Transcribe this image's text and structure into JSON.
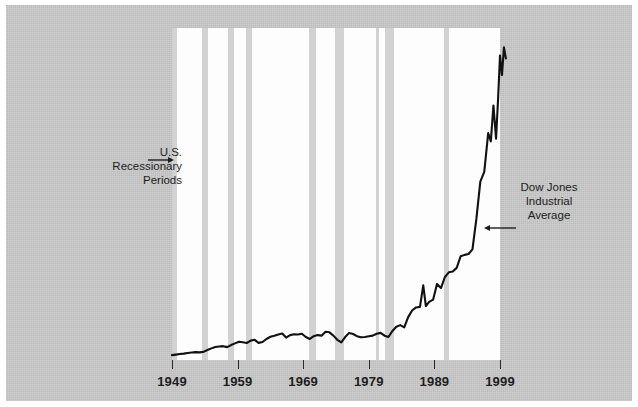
{
  "figure": {
    "background_color": "#c9c9c9",
    "plot_background_color": "#fdfdfd",
    "band_color": "#d2d2d2",
    "line_color": "#111111"
  },
  "annotations": {
    "recession": {
      "line1": "U.S.",
      "line2": "Recessionary",
      "line3": "Periods",
      "arrow": "arrow-right"
    },
    "dow": {
      "line1": "Dow Jones",
      "line2": "Industrial",
      "line3": "Average",
      "arrow": "arrow-left"
    }
  },
  "chart_data": {
    "type": "line",
    "title": "",
    "subtitle": "",
    "xlabel": "",
    "ylabel": "",
    "grid": false,
    "legend_position": "none",
    "xlim": [
      1949,
      1999
    ],
    "ylim": [
      0,
      12000
    ],
    "xticks": [
      1949,
      1959,
      1969,
      1979,
      1989,
      1999
    ],
    "xtick_labels": [
      "1949",
      "1959",
      "1969",
      "1979",
      "1989",
      "1999"
    ],
    "series": [
      {
        "name": "Dow Jones Industrial Average",
        "color": "#111111",
        "x": [
          1949.0,
          1949.6,
          1950.2,
          1950.8,
          1951.4,
          1952.0,
          1952.6,
          1953.2,
          1953.8,
          1954.4,
          1955.0,
          1955.6,
          1956.2,
          1956.8,
          1957.4,
          1958.0,
          1958.6,
          1959.2,
          1959.8,
          1960.4,
          1961.0,
          1961.6,
          1962.2,
          1962.8,
          1963.4,
          1964.0,
          1964.6,
          1965.2,
          1965.8,
          1966.4,
          1967.0,
          1967.6,
          1968.2,
          1968.8,
          1969.4,
          1970.0,
          1970.6,
          1971.2,
          1971.8,
          1972.4,
          1973.0,
          1973.6,
          1974.2,
          1974.8,
          1975.4,
          1976.0,
          1976.6,
          1977.2,
          1977.8,
          1978.4,
          1979.0,
          1979.6,
          1980.2,
          1980.8,
          1981.4,
          1982.0,
          1982.6,
          1983.2,
          1983.8,
          1984.4,
          1985.0,
          1985.6,
          1986.2,
          1986.8,
          1987.3,
          1987.7,
          1988.2,
          1988.8,
          1989.4,
          1990.0,
          1990.6,
          1991.2,
          1991.8,
          1992.4,
          1993.0,
          1993.6,
          1994.2,
          1994.8,
          1995.4,
          1996.0,
          1996.6,
          1997.2,
          1997.6,
          1998.0,
          1998.4,
          1998.7,
          1999.0,
          1999.3,
          1999.6,
          1999.9
        ],
        "y": [
          175,
          195,
          215,
          230,
          255,
          270,
          285,
          275,
          295,
          360,
          420,
          470,
          490,
          500,
          465,
          540,
          600,
          660,
          640,
          615,
          700,
          730,
          620,
          650,
          760,
          840,
          880,
          925,
          960,
          810,
          900,
          930,
          920,
          950,
          830,
          760,
          860,
          900,
          880,
          1020,
          1000,
          880,
          730,
          640,
          830,
          980,
          940,
          860,
          820,
          830,
          860,
          880,
          950,
          980,
          880,
          830,
          1050,
          1200,
          1260,
          1180,
          1550,
          1790,
          1900,
          1920,
          2700,
          1950,
          2100,
          2180,
          2750,
          2600,
          3000,
          3170,
          3200,
          3330,
          3750,
          3800,
          3830,
          4000,
          5100,
          6450,
          6800,
          8200,
          7900,
          9200,
          8000,
          9400,
          11000,
          10300,
          11300,
          10900
        ]
      }
    ],
    "recession_bands": [
      {
        "start": 1948.9,
        "end": 1949.8
      },
      {
        "start": 1953.5,
        "end": 1954.5
      },
      {
        "start": 1957.6,
        "end": 1958.4
      },
      {
        "start": 1960.3,
        "end": 1961.2
      },
      {
        "start": 1969.9,
        "end": 1970.9
      },
      {
        "start": 1973.9,
        "end": 1975.2
      },
      {
        "start": 1980.1,
        "end": 1980.6
      },
      {
        "start": 1981.5,
        "end": 1982.9
      },
      {
        "start": 1990.5,
        "end": 1991.3
      }
    ]
  }
}
